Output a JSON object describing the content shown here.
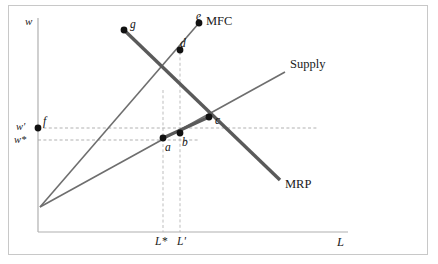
{
  "figure": {
    "background_color": "#ffffff",
    "frame_color": "#c8c8c8",
    "line_color": "#6e6e6e",
    "thick_line_color": "#5a5a5a",
    "dash_color": "#a8a8a8",
    "point_color": "#111111"
  },
  "axes": {
    "y_axis_label": "w",
    "x_axis_label": "L",
    "x_axis_y_px": 232,
    "y_axis_x_px": 38,
    "origin_x_px": 40,
    "origin_y_px": 207
  },
  "ticks": {
    "x": [
      {
        "label": "L*",
        "x_px": 163
      },
      {
        "label": "L'",
        "x_px": 182
      }
    ],
    "y": [
      {
        "label": "w'",
        "y_px": 127
      },
      {
        "label": "w*",
        "y_px": 140
      }
    ]
  },
  "curves": [
    {
      "name": "MFC",
      "label": "MFC",
      "label_x_px": 206,
      "label_y_px": 22,
      "type": "line",
      "thick": false,
      "from": {
        "x": 40,
        "y": 207
      },
      "to": {
        "x": 199,
        "y": 23
      }
    },
    {
      "name": "Supply",
      "label": "Supply",
      "label_x_px": 290,
      "label_y_px": 65,
      "type": "line",
      "thick": false,
      "from": {
        "x": 40,
        "y": 207
      },
      "to": {
        "x": 285,
        "y": 72
      }
    },
    {
      "name": "MRP",
      "label": "MRP",
      "label_x_px": 285,
      "label_y_px": 185,
      "type": "line",
      "thick": true,
      "from": {
        "x": 124,
        "y": 30
      },
      "to": {
        "x": 280,
        "y": 180
      }
    }
  ],
  "points": [
    {
      "id": "g",
      "label": "g",
      "x_px": 124,
      "y_px": 30,
      "label_dx": 6,
      "label_dy": -11
    },
    {
      "id": "e",
      "label": "e",
      "x_px": 199,
      "y_px": 23,
      "label_dx": -2,
      "label_dy": -12
    },
    {
      "id": "d",
      "label": "d",
      "x_px": 180,
      "y_px": 50,
      "label_dx": 1,
      "label_dy": -12
    },
    {
      "id": "c",
      "label": "c",
      "x_px": 209,
      "y_px": 117,
      "label_dx": 6,
      "label_dy": -2
    },
    {
      "id": "b",
      "label": "b",
      "x_px": 180,
      "y_px": 133,
      "label_dx": 2,
      "label_dy": 4
    },
    {
      "id": "a",
      "label": "a",
      "x_px": 163,
      "y_px": 138,
      "label_dx": 2,
      "label_dy": 4
    },
    {
      "id": "f",
      "label": "f",
      "x_px": 38,
      "y_px": 128,
      "label_dx": 5,
      "label_dy": -12
    }
  ],
  "guide_lines": [
    {
      "name": "w-prime-horizontal",
      "orientation": "horizontal",
      "y_px": 128,
      "x1_px": 38,
      "x2_px": 318
    },
    {
      "name": "w-star-horizontal",
      "orientation": "horizontal",
      "y_px": 140,
      "x1_px": 38,
      "x2_px": 200
    },
    {
      "name": "L-star-vertical",
      "orientation": "vertical",
      "x_px": 163,
      "y1_px": 90,
      "y2_px": 232
    },
    {
      "name": "L-prime-vertical",
      "orientation": "vertical",
      "x_px": 180,
      "y1_px": 52,
      "y2_px": 232
    }
  ]
}
